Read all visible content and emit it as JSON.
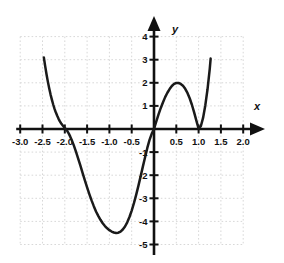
{
  "chart_data": {
    "type": "line",
    "title": "",
    "xlabel": "x",
    "ylabel": "y",
    "xlim": [
      -3.0,
      2.0
    ],
    "ylim": [
      -5,
      4
    ],
    "grid": true,
    "legend_position": "none",
    "x_ticks": [
      -3.0,
      -2.5,
      -2.0,
      -1.5,
      -1.0,
      -0.5,
      0.5,
      1.0,
      1.5,
      2.0
    ],
    "x_tick_labels": [
      "-3.0",
      "-2.5",
      "-2.0",
      "-1.5",
      "-1.0",
      "-0.5",
      "0.5",
      "1.0",
      "1.5",
      "2.0"
    ],
    "y_ticks": [
      4,
      3,
      2,
      1,
      -1,
      -2,
      -3,
      -4,
      -5
    ],
    "y_tick_labels": [
      "4",
      "3",
      "2",
      "1",
      "-1",
      "-2",
      "-3",
      "-4",
      "-5"
    ],
    "curve_color": "#1a1a1a",
    "grid_color": "#d8d8d8",
    "axis_color": "#111111",
    "series": [
      {
        "name": "polynomial",
        "x": [
          -2.47,
          -2.44,
          -2.41,
          -2.38,
          -2.35,
          -2.32,
          -2.29,
          -2.26,
          -2.23,
          -2.2,
          -2.17,
          -2.14,
          -2.11,
          -2.08,
          -2.05,
          -2.02,
          -2.0,
          -1.97,
          -1.94,
          -1.91,
          -1.88,
          -1.85,
          -1.8,
          -1.75,
          -1.7,
          -1.65,
          -1.6,
          -1.55,
          -1.5,
          -1.45,
          -1.4,
          -1.35,
          -1.3,
          -1.25,
          -1.2,
          -1.15,
          -1.1,
          -1.05,
          -1.0,
          -0.95,
          -0.9,
          -0.85,
          -0.8,
          -0.75,
          -0.7,
          -0.65,
          -0.6,
          -0.55,
          -0.5,
          -0.45,
          -0.4,
          -0.35,
          -0.3,
          -0.25,
          -0.2,
          -0.15,
          -0.1,
          -0.05,
          0.0,
          0.05,
          0.1,
          0.15,
          0.2,
          0.25,
          0.3,
          0.35,
          0.4,
          0.45,
          0.5,
          0.55,
          0.6,
          0.65,
          0.7,
          0.75,
          0.8,
          0.85,
          0.9,
          0.95,
          1.0,
          1.05,
          1.1,
          1.15,
          1.2,
          1.25,
          1.27
        ],
        "y": [
          3.1,
          2.72,
          2.37,
          2.05,
          1.76,
          1.5,
          1.27,
          1.06,
          0.87,
          0.71,
          0.57,
          0.44,
          0.33,
          0.24,
          0.16,
          0.09,
          0.05,
          -0.02,
          -0.1,
          -0.2,
          -0.32,
          -0.45,
          -0.7,
          -0.98,
          -1.28,
          -1.59,
          -1.91,
          -2.22,
          -2.53,
          -2.82,
          -3.09,
          -3.34,
          -3.57,
          -3.76,
          -3.93,
          -4.08,
          -4.2,
          -4.3,
          -4.38,
          -4.44,
          -4.48,
          -4.5,
          -4.49,
          -4.44,
          -4.35,
          -4.22,
          -4.04,
          -3.81,
          -3.53,
          -3.21,
          -2.85,
          -2.46,
          -2.05,
          -1.63,
          -1.22,
          -0.82,
          -0.47,
          -0.2,
          0.0,
          0.32,
          0.62,
          0.9,
          1.15,
          1.38,
          1.57,
          1.73,
          1.86,
          1.95,
          1.99,
          1.99,
          1.95,
          1.87,
          1.74,
          1.56,
          1.33,
          1.05,
          0.72,
          0.36,
          0.02,
          0.12,
          0.48,
          1.02,
          1.72,
          2.6,
          3.05
        ]
      }
    ]
  },
  "axis_labels": {
    "x": "x",
    "y": "y"
  }
}
